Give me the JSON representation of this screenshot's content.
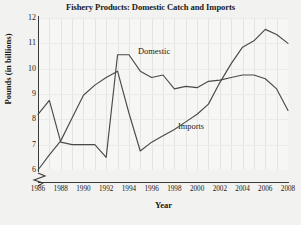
{
  "chart_data": {
    "type": "line",
    "title": "Fishery Products: Domestic Catch and Imports",
    "xlabel": "Year",
    "ylabel": "Pounds (in billions)",
    "xlim": [
      1986,
      2008
    ],
    "ylim": [
      6,
      12
    ],
    "yticks": [
      6,
      7,
      8,
      9,
      10,
      11,
      12
    ],
    "xticks": [
      1986,
      1988,
      1990,
      1992,
      1994,
      1996,
      1998,
      2000,
      2002,
      2004,
      2006,
      2008
    ],
    "grid": "faint vertical gridlines at every year",
    "y_axis_break": true,
    "legend": "inline series labels on plot",
    "x": [
      1986,
      1987,
      1988,
      1989,
      1990,
      1991,
      1992,
      1993,
      1994,
      1995,
      1996,
      1997,
      1998,
      1999,
      2000,
      2001,
      2002,
      2003,
      2004,
      2005,
      2006,
      2007,
      2008
    ],
    "series": [
      {
        "name": "Domestic",
        "label_position": "above line near 1994",
        "values": [
          8.2,
          8.75,
          7.1,
          7.0,
          7.0,
          7.0,
          6.5,
          10.55,
          10.55,
          9.9,
          9.65,
          9.75,
          9.2,
          9.3,
          9.25,
          9.5,
          9.55,
          9.65,
          9.75,
          9.75,
          9.6,
          9.2,
          8.35
        ]
      },
      {
        "name": "Imports",
        "label_position": "below line near 2000",
        "values": [
          6.0,
          6.6,
          7.15,
          8.05,
          8.95,
          9.35,
          9.65,
          9.9,
          8.25,
          6.75,
          7.1,
          7.35,
          7.6,
          7.9,
          8.2,
          8.6,
          9.45,
          10.2,
          10.85,
          11.1,
          11.55,
          11.35,
          11.0
        ]
      }
    ]
  },
  "ytick_labels": [
    "12",
    "11",
    "10",
    "9",
    "8",
    "7",
    "6"
  ],
  "xtick_labels": [
    "1986",
    "1988",
    "1990",
    "1992",
    "1994",
    "1996",
    "1998",
    "2000",
    "2002",
    "2004",
    "2006",
    "2008"
  ],
  "series_labels": {
    "domestic": "Domestic",
    "imports": "Imports"
  }
}
